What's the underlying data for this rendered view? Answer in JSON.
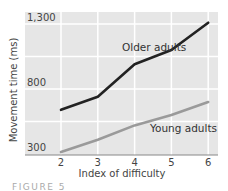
{
  "chart_data": {
    "type": "line",
    "title": "",
    "xlabel": "Index of difficulty",
    "ylabel": "Movement time (ms)",
    "x": [
      2,
      3,
      4,
      5,
      6
    ],
    "categories": [
      "2",
      "3",
      "4",
      "5",
      "6"
    ],
    "y_ticks": [
      "1,300",
      "800",
      "300"
    ],
    "ylim": [
      300,
      1300
    ],
    "grid": true,
    "legend_position": "inline labels",
    "series": [
      {
        "name": "Older adults",
        "values": [
          640,
          740,
          990,
          1100,
          1310
        ],
        "color": "#222222"
      },
      {
        "name": "Young adults",
        "values": [
          315,
          410,
          520,
          600,
          700
        ],
        "color": "#9a9a9a"
      }
    ],
    "annotations": [
      "Older adults",
      "Young adults"
    ]
  },
  "caption": "FIGURE 5"
}
